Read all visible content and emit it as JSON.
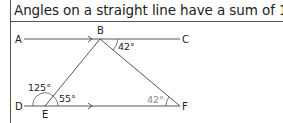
{
  "title": "Angles on a straight line have a sum of 180°.",
  "diagram": {
    "points": {
      "A": "A",
      "B": "B",
      "C": "C",
      "D": "D",
      "E": "E",
      "F": "F"
    },
    "angles": {
      "CBF": "42°",
      "DEB": "125°",
      "BEF": "55°",
      "BFE": "42°"
    },
    "colors": {
      "line": "#555555",
      "label": "#222222",
      "highlight_angle": "#888888"
    }
  }
}
